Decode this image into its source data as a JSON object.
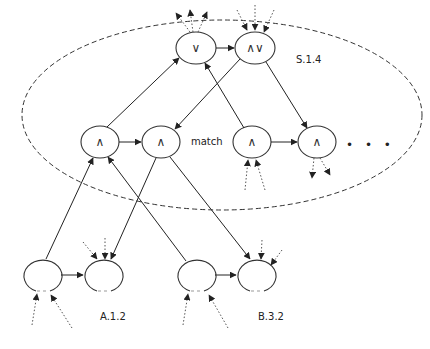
{
  "diagram": {
    "type": "network-diagram",
    "colors": {
      "stroke": "#333333",
      "background": "#ffffff"
    },
    "region_label": "S.1.4",
    "labels": {
      "match": "match",
      "a": "A.1.2",
      "b": "B.3.2",
      "ellipsis": "• • •"
    },
    "nodes": [
      {
        "id": "top-or",
        "symbol": "∨",
        "x": 196,
        "y": 48
      },
      {
        "id": "top-andor",
        "symbol": "∧∨",
        "x": 255,
        "y": 48
      },
      {
        "id": "mid-and-1",
        "symbol": "∧",
        "x": 100,
        "y": 142
      },
      {
        "id": "mid-and-2",
        "symbol": "∧",
        "x": 161,
        "y": 142
      },
      {
        "id": "mid-and-3",
        "symbol": "∧",
        "x": 252,
        "y": 142
      },
      {
        "id": "mid-and-4",
        "symbol": "∧",
        "x": 317,
        "y": 142
      },
      {
        "id": "bot-a1",
        "symbol": "",
        "x": 42,
        "y": 275
      },
      {
        "id": "bot-a2",
        "symbol": "",
        "x": 103,
        "y": 275
      },
      {
        "id": "bot-b1",
        "symbol": "",
        "x": 196,
        "y": 275
      },
      {
        "id": "bot-b2",
        "symbol": "",
        "x": 256,
        "y": 275
      }
    ]
  }
}
